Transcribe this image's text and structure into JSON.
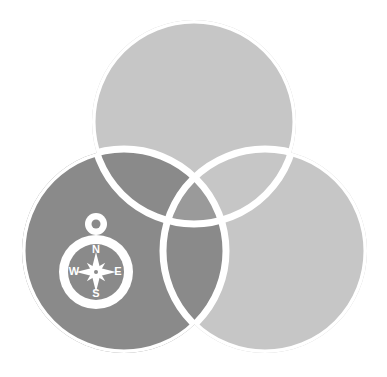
{
  "artwork": {
    "title": "Three overlapping circles logo with compass",
    "background_color": "#ffffff",
    "width": 387,
    "height": 377
  },
  "palette": {
    "circle_light": "#c6c6c6",
    "circle_dark": "#8a8a8a",
    "overlap_mid": "#b0b0b0",
    "overlap_center": "#9a9a9a",
    "stroke_white": "#ffffff",
    "compass_white": "#ffffff"
  },
  "circles": [
    {
      "name": "top-circle",
      "cx": 194,
      "cy": 122,
      "r": 102,
      "fill": "#c6c6c6"
    },
    {
      "name": "bottom-right-circle",
      "cx": 265,
      "cy": 251,
      "r": 102,
      "fill": "#c6c6c6"
    },
    {
      "name": "bottom-left-circle",
      "cx": 124,
      "cy": 251,
      "r": 102,
      "fill": "#8a8a8a"
    }
  ],
  "stroke": {
    "color": "#ffffff",
    "width": 7
  },
  "compass": {
    "name": "compass-icon",
    "cx": 96,
    "cy": 272,
    "outer_radius": 37,
    "inner_radius": 28,
    "ring_color": "#ffffff",
    "face_color": "#8a8a8a",
    "loop_cy": 224,
    "loop_outer_radius": 11,
    "loop_inner_radius": 4.5,
    "labels": {
      "north": "N",
      "east": "E",
      "south": "S",
      "west": "W"
    },
    "label_color": "#ffffff",
    "label_size": 11,
    "rose": {
      "points": 8,
      "long_ray": 20,
      "short_ray": 13,
      "waist": 5,
      "hub_outer_radius": 4.5,
      "hub_inner_radius": 2
    }
  }
}
